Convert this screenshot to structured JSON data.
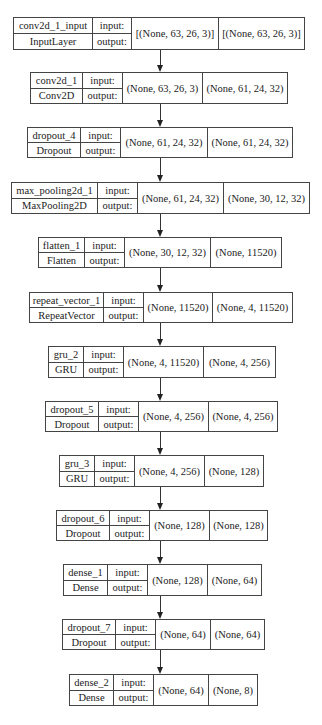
{
  "diagram": {
    "type": "keras-model-plot",
    "io_labels": {
      "input": "input:",
      "output": "output:"
    },
    "layers": [
      {
        "name": "conv2d_1_input",
        "class": "InputLayer",
        "input_shape": "[(None, 63, 26, 3)]",
        "output_shape": "[(None, 63, 26, 3)]"
      },
      {
        "name": "conv2d_1",
        "class": "Conv2D",
        "input_shape": "(None, 63, 26, 3)",
        "output_shape": "(None, 61, 24, 32)"
      },
      {
        "name": "dropout_4",
        "class": "Dropout",
        "input_shape": "(None, 61, 24, 32)",
        "output_shape": "(None, 61, 24, 32)"
      },
      {
        "name": "max_pooling2d_1",
        "class": "MaxPooling2D",
        "input_shape": "(None, 61, 24, 32)",
        "output_shape": "(None, 30, 12, 32)"
      },
      {
        "name": "flatten_1",
        "class": "Flatten",
        "input_shape": "(None, 30, 12, 32)",
        "output_shape": "(None, 11520)"
      },
      {
        "name": "repeat_vector_1",
        "class": "RepeatVector",
        "input_shape": "(None, 11520)",
        "output_shape": "(None, 4, 11520)"
      },
      {
        "name": "gru_2",
        "class": "GRU",
        "input_shape": "(None, 4, 11520)",
        "output_shape": "(None, 4, 256)"
      },
      {
        "name": "dropout_5",
        "class": "Dropout",
        "input_shape": "(None, 4, 256)",
        "output_shape": "(None, 4, 256)"
      },
      {
        "name": "gru_3",
        "class": "GRU",
        "input_shape": "(None, 4, 256)",
        "output_shape": "(None, 128)"
      },
      {
        "name": "dropout_6",
        "class": "Dropout",
        "input_shape": "(None, 128)",
        "output_shape": "(None, 128)"
      },
      {
        "name": "dense_1",
        "class": "Dense",
        "input_shape": "(None, 128)",
        "output_shape": "(None, 64)"
      },
      {
        "name": "dropout_7",
        "class": "Dropout",
        "input_shape": "(None, 64)",
        "output_shape": "(None, 64)"
      },
      {
        "name": "dense_2",
        "class": "Dense",
        "input_shape": "(None, 64)",
        "output_shape": "(None, 8)"
      }
    ],
    "edges": [
      [
        0,
        1
      ],
      [
        1,
        2
      ],
      [
        2,
        3
      ],
      [
        3,
        4
      ],
      [
        4,
        5
      ],
      [
        5,
        6
      ],
      [
        6,
        7
      ],
      [
        7,
        8
      ],
      [
        8,
        9
      ],
      [
        9,
        10
      ],
      [
        10,
        11
      ],
      [
        11,
        12
      ]
    ]
  }
}
